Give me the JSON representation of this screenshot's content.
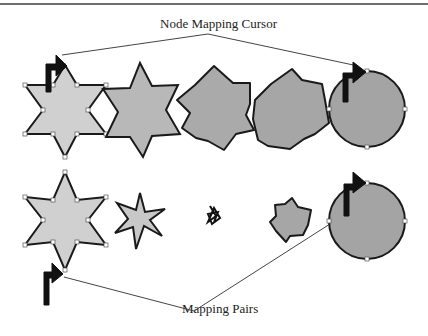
{
  "diagram": {
    "labels": {
      "top": "Node Mapping Cursor",
      "bottom": "Mapping Pairs"
    },
    "colors": {
      "light_fill": "#cfcfcf",
      "mid_fill": "#b5b5b5",
      "dark_fill": "#a4a4a4",
      "stroke": "#1a1a1a",
      "connector": "#444444"
    },
    "rows": [
      {
        "name": "morph-sequence",
        "shapes": [
          "six-point-star",
          "six-point-star",
          "rounded-star",
          "blob",
          "circle"
        ]
      },
      {
        "name": "mapping-pairs",
        "shapes": [
          "six-point-star",
          "thin-star",
          "scribble",
          "small-blob",
          "circle"
        ]
      }
    ]
  }
}
